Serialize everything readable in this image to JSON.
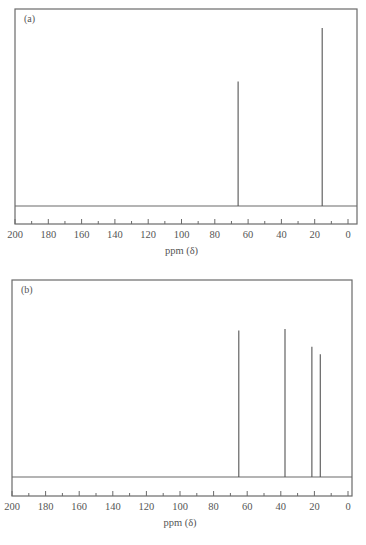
{
  "chart_data": [
    {
      "type": "bar",
      "subtype": "nmr-stick-spectrum",
      "panel_label": "(a)",
      "xlabel": "ppm (δ)",
      "ylabel": "",
      "xlim": [
        200,
        0
      ],
      "x_ticks": [
        200,
        180,
        160,
        140,
        120,
        100,
        80,
        60,
        40,
        20,
        0
      ],
      "x_minor_step": 10,
      "grid": false,
      "peaks": [
        {
          "ppm": 66,
          "relative_height": 0.7
        },
        {
          "ppm": 15.5,
          "relative_height": 1.0
        }
      ]
    },
    {
      "type": "bar",
      "subtype": "nmr-stick-spectrum",
      "panel_label": "(b)",
      "xlabel": "ppm (δ)",
      "ylabel": "",
      "xlim": [
        200,
        0
      ],
      "x_ticks": [
        200,
        180,
        160,
        140,
        120,
        100,
        80,
        60,
        40,
        20,
        0
      ],
      "x_minor_step": 10,
      "grid": false,
      "peaks": [
        {
          "ppm": 65,
          "relative_height": 0.99
        },
        {
          "ppm": 37.5,
          "relative_height": 1.0
        },
        {
          "ppm": 21.5,
          "relative_height": 0.88
        },
        {
          "ppm": 16.5,
          "relative_height": 0.83
        }
      ]
    }
  ],
  "colors": {
    "frame": "#6a6a6a",
    "peak": "#555555",
    "text": "#555555"
  }
}
